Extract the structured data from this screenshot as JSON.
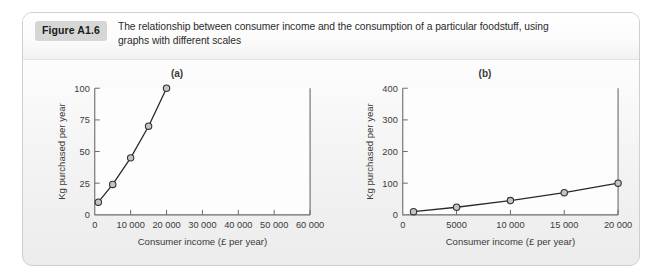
{
  "figure": {
    "badge_label": "Figure A1.6",
    "caption_line1": "The relationship between consumer income and the consumption of a particular foodstuff, using",
    "caption_line2": "graphs with different scales"
  },
  "colors": {
    "panel_border": "#cfcfcf",
    "badge_bg": "#d6d6d6",
    "axis": "#6a6a6a",
    "line": "#2a2a2a",
    "marker_fill": "#c4c4c4",
    "marker_stroke": "#333333",
    "text": "#2b2b2b"
  },
  "chart_data": [
    {
      "type": "line",
      "title": "(a)",
      "xlabel": "Consumer income (£ per year)",
      "ylabel": "Kg purchased per year",
      "x": [
        1000,
        5000,
        10000,
        15000,
        20000
      ],
      "values": [
        10,
        24,
        45,
        70,
        100
      ],
      "xlim": [
        0,
        60000
      ],
      "ylim": [
        0,
        100
      ],
      "xticks": [
        0,
        10000,
        20000,
        30000,
        40000,
        50000,
        60000
      ],
      "xtick_labels": [
        "0",
        "10 000",
        "20 000",
        "30 000",
        "40 000",
        "50 000",
        "60 000"
      ],
      "yticks": [
        0,
        25,
        50,
        75,
        100
      ],
      "ytick_labels": [
        "0",
        "25",
        "50",
        "75",
        "100"
      ],
      "grid": false,
      "legend": "none",
      "marker": "open-circle"
    },
    {
      "type": "line",
      "title": "(b)",
      "xlabel": "Consumer income (£ per year)",
      "ylabel": "Kg purchased per year",
      "x": [
        1000,
        5000,
        10000,
        15000,
        20000
      ],
      "values": [
        10,
        24,
        45,
        70,
        100
      ],
      "xlim": [
        0,
        20000
      ],
      "ylim": [
        0,
        400
      ],
      "xticks": [
        0,
        5000,
        10000,
        15000,
        20000
      ],
      "xtick_labels": [
        "0",
        "5000",
        "10 000",
        "15 000",
        "20 000"
      ],
      "yticks": [
        0,
        100,
        200,
        300,
        400
      ],
      "ytick_labels": [
        "0",
        "100",
        "200",
        "300",
        "400"
      ],
      "grid": false,
      "legend": "none",
      "marker": "open-circle"
    }
  ]
}
